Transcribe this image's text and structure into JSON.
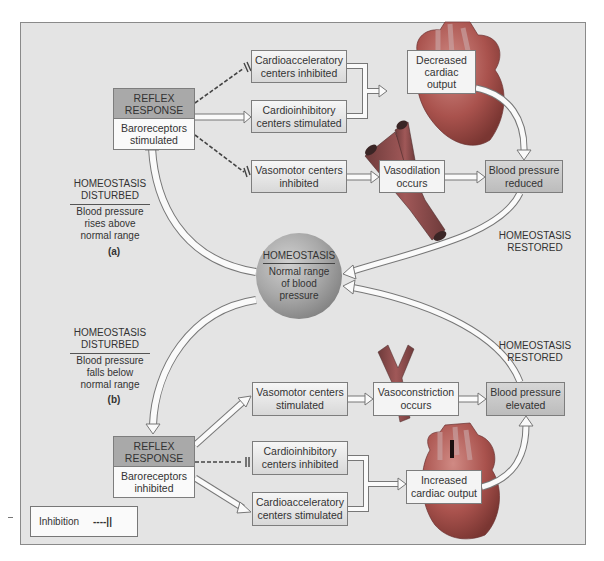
{
  "panel_a": {
    "label": "(a)",
    "disturbed": {
      "title_line1": "HOMEOSTASIS",
      "title_line2": "DISTURBED",
      "desc_line1": "Blood pressure",
      "desc_line2": "rises above",
      "desc_line3": "normal range"
    },
    "reflex": {
      "top_line1": "REFLEX",
      "top_line2": "RESPONSE",
      "bot_line1": "Baroreceptors",
      "bot_line2": "stimulated"
    },
    "boxes": [
      {
        "line1": "Cardioacceleratory",
        "line2": "centers inhibited"
      },
      {
        "line1": "Cardioinhibitory",
        "line2": "centers stimulated"
      },
      {
        "line1": "Vasomotor centers",
        "line2": "inhibited"
      },
      {
        "line1": "Decreased",
        "line2": "cardiac",
        "line3": "output"
      },
      {
        "line1": "Vasodilation",
        "line2": "occurs"
      },
      {
        "line1": "Blood pressure",
        "line2": "reduced"
      }
    ],
    "restored": {
      "line1": "HOMEOSTASIS",
      "line2": "RESTORED"
    }
  },
  "center": {
    "title": "HOMEOSTASIS",
    "line1": "Normal range",
    "line2": "of blood",
    "line3": "pressure"
  },
  "panel_b": {
    "label": "(b)",
    "disturbed": {
      "title_line1": "HOMEOSTASIS",
      "title_line2": "DISTURBED",
      "desc_line1": "Blood pressure",
      "desc_line2": "falls below",
      "desc_line3": "normal range"
    },
    "reflex": {
      "top_line1": "REFLEX",
      "top_line2": "RESPONSE",
      "bot_line1": "Baroreceptors",
      "bot_line2": "inhibited"
    },
    "boxes": [
      {
        "line1": "Vasomotor centers",
        "line2": "stimulated"
      },
      {
        "line1": "Vasoconstriction",
        "line2": "occurs"
      },
      {
        "line1": "Blood pressure",
        "line2": "elevated"
      },
      {
        "line1": "Cardioinhibitory",
        "line2": "centers inhibited"
      },
      {
        "line1": "Cardioacceleratory",
        "line2": "centers stimulated"
      },
      {
        "line1": "Increased",
        "line2": "cardiac output"
      }
    ],
    "restored": {
      "line1": "HOMEOSTASIS",
      "line2": "RESTORED"
    }
  },
  "legend": {
    "label": "Inhibition",
    "symbol": "----||"
  },
  "colors": {
    "panel_bg": "#e4e4e4",
    "reflex_header": "#a9a9a9",
    "heart": "#b55a55",
    "vessel": "#8e4a4a"
  }
}
